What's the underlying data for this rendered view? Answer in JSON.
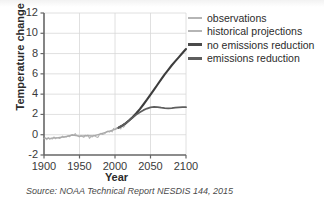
{
  "caption": "Source: NOAA Technical Report NESDIS 144, 2015",
  "legend": {
    "items": [
      {
        "label": "observations",
        "color": "#b5b5b5",
        "style": "thin"
      },
      {
        "label": "historical projections",
        "color": "#b5b5b5",
        "style": "thin"
      },
      {
        "label": "no emissions reduction",
        "color": "#4a4a4a",
        "style": "thick"
      },
      {
        "label": "emissions reduction",
        "color": "#5e5e5e",
        "style": "mid"
      }
    ]
  },
  "chart_data": {
    "type": "line",
    "title": "",
    "xlabel": "Year",
    "ylabel": "Temperature change (°F)",
    "xlim": [
      1900,
      2100
    ],
    "ylim": [
      -2,
      12
    ],
    "xticks": [
      1900,
      1950,
      2000,
      2050,
      2100
    ],
    "yticks": [
      -2,
      0,
      2,
      4,
      6,
      8,
      10,
      12
    ],
    "xtick_labels": [
      "1900",
      "1950",
      "2000",
      "2050",
      "2100"
    ],
    "ytick_labels": [
      "-2",
      "0",
      "2",
      "4",
      "6",
      "8",
      "10",
      "12"
    ],
    "grid": true,
    "legend_position": "right",
    "series": [
      {
        "name": "observations",
        "color": "#b5b5b5",
        "width": 1.1,
        "x": [
          1900,
          1902,
          1904,
          1906,
          1908,
          1910,
          1912,
          1914,
          1916,
          1918,
          1920,
          1922,
          1924,
          1926,
          1928,
          1930,
          1932,
          1934,
          1936,
          1938,
          1940,
          1942,
          1944,
          1946,
          1948,
          1950,
          1952,
          1954,
          1956,
          1958,
          1960,
          1962,
          1964,
          1966,
          1968,
          1970,
          1972,
          1974,
          1976,
          1978,
          1980,
          1982,
          1984,
          1986,
          1988,
          1990,
          1992,
          1994,
          1996,
          1998,
          2000,
          2002,
          2004,
          2006,
          2008,
          2010,
          2012,
          2014
        ],
        "y": [
          -0.4,
          -0.3,
          -0.48,
          -0.28,
          -0.45,
          -0.38,
          -0.42,
          -0.22,
          -0.4,
          -0.3,
          -0.32,
          -0.36,
          -0.3,
          -0.14,
          -0.26,
          -0.18,
          -0.22,
          -0.1,
          -0.2,
          -0.04,
          0.02,
          -0.06,
          0.1,
          -0.08,
          -0.12,
          -0.22,
          -0.08,
          -0.18,
          -0.26,
          -0.06,
          -0.1,
          -0.04,
          -0.36,
          -0.18,
          -0.22,
          -0.06,
          -0.14,
          -0.22,
          -0.26,
          0.0,
          0.14,
          0.02,
          0.06,
          0.12,
          0.3,
          0.36,
          0.26,
          0.36,
          0.28,
          0.62,
          0.5,
          0.68,
          0.64,
          0.74,
          0.56,
          0.86,
          0.74,
          0.9
        ]
      },
      {
        "name": "historical projections",
        "color": "#a9a9a9",
        "width": 1.3,
        "x": [
          1900,
          1910,
          1920,
          1930,
          1940,
          1950,
          1960,
          1970,
          1980,
          1990,
          2000,
          2005,
          2010,
          2015
        ],
        "y": [
          -0.38,
          -0.34,
          -0.28,
          -0.2,
          -0.05,
          -0.14,
          -0.1,
          -0.12,
          0.08,
          0.3,
          0.52,
          0.66,
          0.82,
          1.05
        ]
      },
      {
        "name": "no emissions reduction",
        "color": "#3d3d3d",
        "width": 2.1,
        "x": [
          2005,
          2010,
          2015,
          2020,
          2025,
          2030,
          2035,
          2040,
          2045,
          2050,
          2055,
          2060,
          2065,
          2070,
          2075,
          2080,
          2085,
          2090,
          2095,
          2100
        ],
        "y": [
          0.7,
          0.9,
          1.12,
          1.42,
          1.75,
          2.12,
          2.52,
          2.98,
          3.45,
          3.95,
          4.45,
          4.95,
          5.45,
          5.95,
          6.4,
          6.85,
          7.25,
          7.65,
          8.05,
          8.45
        ]
      },
      {
        "name": "emissions reduction",
        "color": "#5e5e5e",
        "width": 1.8,
        "x": [
          2005,
          2010,
          2015,
          2020,
          2025,
          2030,
          2035,
          2040,
          2045,
          2050,
          2055,
          2060,
          2065,
          2070,
          2075,
          2080,
          2085,
          2090,
          2095,
          2100
        ],
        "y": [
          0.7,
          0.9,
          1.12,
          1.4,
          1.7,
          1.98,
          2.22,
          2.42,
          2.58,
          2.7,
          2.74,
          2.72,
          2.66,
          2.62,
          2.6,
          2.62,
          2.66,
          2.7,
          2.72,
          2.72
        ]
      }
    ]
  }
}
